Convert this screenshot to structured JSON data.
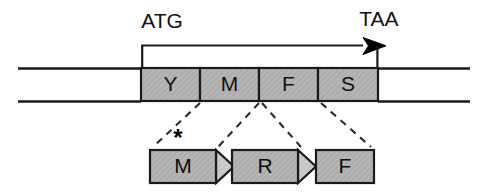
{
  "figure": {
    "background_color": "#ffffff",
    "stroke_color": "#1a1a1a",
    "box_fill_color": "#b5b5b5",
    "arrowhead_fill_color": "#c9c9c9",
    "label_color": "#111111"
  },
  "top_track": {
    "start_codon_label": "ATG",
    "stop_codon_label": "TAA",
    "orf_arrow_name": "open-reading-frame-arrow",
    "left_line_label": "",
    "right_line_label": "",
    "codon_boxes": [
      {
        "label": "Y",
        "x": 141,
        "width": 59
      },
      {
        "label": "M",
        "x": 200,
        "width": 59
      },
      {
        "label": "F",
        "x": 259,
        "width": 59
      },
      {
        "label": "S",
        "x": 318,
        "width": 60
      }
    ],
    "box_y": 68,
    "box_height": 33,
    "chromosome_line_top_y": 68,
    "chromosome_line_bottom_y": 101
  },
  "bottom_track": {
    "asterisk_label": "*",
    "peptide_shapes": [
      {
        "label": "M",
        "x": 150,
        "width": 66,
        "has_arrowhead": true,
        "arrow_tip": 234
      },
      {
        "label": "R",
        "x": 232,
        "width": 66,
        "has_arrowhead": true,
        "arrow_tip": 316
      },
      {
        "label": "F",
        "x": 316,
        "width": 58,
        "has_arrowhead": false,
        "arrow_tip": 374
      }
    ],
    "shape_y": 150,
    "shape_height": 33
  },
  "connectors": [
    {
      "name": "connector-1",
      "x1": 200,
      "y1": 103,
      "x2": 153,
      "y2": 146
    },
    {
      "name": "connector-2",
      "x1": 259,
      "y1": 103,
      "x2": 218,
      "y2": 146
    },
    {
      "name": "connector-3",
      "x1": 262,
      "y1": 103,
      "x2": 300,
      "y2": 146
    },
    {
      "name": "connector-4",
      "x1": 321,
      "y1": 103,
      "x2": 371,
      "y2": 146
    }
  ]
}
